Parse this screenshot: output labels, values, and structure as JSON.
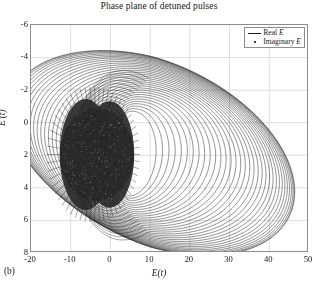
{
  "figure": {
    "title": "Phase plane of detuned pulses",
    "panel_label": "(b)"
  },
  "legend": {
    "position": "top-right",
    "entries": [
      {
        "label_prefix": "Real ",
        "label_var": "E",
        "marker": "line"
      },
      {
        "label_prefix": "Imaginary ",
        "label_var": "E",
        "marker": "dot"
      }
    ]
  },
  "axes": {
    "xlabel_prefix": "E",
    "xlabel_suffix": "(t)",
    "ylabel_prefix": "E",
    "ylabel_suffix": "'(t)",
    "x_ticks": [
      "-20",
      "-10",
      "0",
      "10",
      "20",
      "30",
      "40",
      "50"
    ],
    "y_ticks": [
      "8",
      "6",
      "4",
      "2",
      "0",
      "-2",
      "-4",
      "-6"
    ],
    "grid": true
  },
  "chart_data": {
    "type": "line",
    "title": "Phase plane of detuned pulses",
    "xlabel": "E(t)",
    "ylabel": "E'(t)",
    "xlim": [
      -20,
      50
    ],
    "ylim": [
      -6,
      8
    ],
    "xticks": [
      -20,
      -10,
      0,
      10,
      20,
      30,
      40,
      50
    ],
    "yticks": [
      -6,
      -4,
      -2,
      0,
      2,
      4,
      6,
      8
    ],
    "grid": true,
    "legend": [
      "Real E",
      "Imaginary E"
    ],
    "legend_position": "upper right",
    "series": [
      {
        "name": "Real E",
        "style": "solid-line",
        "color": "#1a1a1a",
        "orbit_family": {
          "count": 34,
          "center_x": 10.5,
          "center_y": 0.2,
          "outer_rx": 36.0,
          "outer_ry": 5.85,
          "inner_rx": 6.5,
          "inner_ry": 2.6,
          "shrink": "geometric",
          "tilt_deg_outer": -4.0,
          "tilt_deg_inner": 2.0,
          "x_offset_outer": 0.0,
          "x_offset_inner": -5.5
        }
      },
      {
        "name": "Imaginary E",
        "style": "dotted",
        "color": "#1a1a1a",
        "core": {
          "center_x": -3.4,
          "center_y": 0.05,
          "rx": 9.4,
          "ry": 3.55,
          "spoke_count": 58,
          "spoke_len": 3.2,
          "fill": "dense"
        }
      }
    ],
    "notable_features": [
      {
        "name": "outer-orbit-right-extent",
        "x": 46.5,
        "y": 0.2
      },
      {
        "name": "outer-orbit-top",
        "x": 20.0,
        "y": 6.05
      },
      {
        "name": "outer-orbit-bottom",
        "x": 22.0,
        "y": -5.6
      },
      {
        "name": "core-left-extent",
        "x": -13.0,
        "y": 0.0
      },
      {
        "name": "core-right-extent",
        "x": 6.5,
        "y": 0.0
      }
    ]
  },
  "colors": {
    "curve": "#1a1a1a",
    "grid": "#d5d5d5",
    "frame": "#8d8d8d",
    "background": "#ffffff",
    "text": "#161616"
  }
}
